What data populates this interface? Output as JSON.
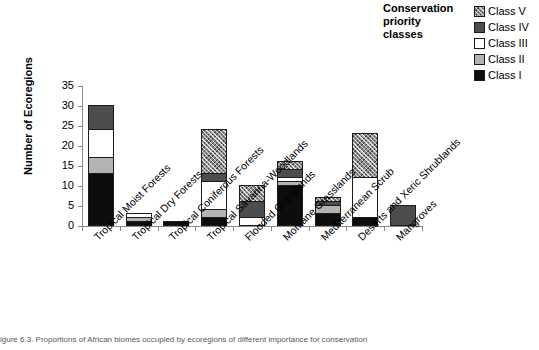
{
  "legend": {
    "title": "Conservation priority classes",
    "title_lines": [
      "Conservation",
      "priority",
      "classes"
    ],
    "items": [
      {
        "label": "Class V",
        "swatch": "hatched-gray",
        "color": "#8f8f8f"
      },
      {
        "label": "Class IV",
        "swatch": "dark-gray",
        "color": "#4d4d4d"
      },
      {
        "label": "Class III",
        "swatch": "white",
        "color": "#ffffff"
      },
      {
        "label": "Class II",
        "swatch": "light-gray",
        "color": "#b3b3b3"
      },
      {
        "label": "Class I",
        "swatch": "black",
        "color": "#0d0d0d"
      }
    ]
  },
  "axes": {
    "y_title": "Number of Ecoregions",
    "y_ticks": [
      "0",
      "5",
      "10",
      "15",
      "20",
      "25",
      "30",
      "35"
    ]
  },
  "caption": "igure 6.3. Proportions of African biomes occupied by ecoregions of different importance for conservation",
  "chart_data": {
    "type": "bar",
    "stacked": true,
    "title": "",
    "xlabel": "",
    "ylabel": "Number of Ecoregions",
    "ylim": [
      0,
      35
    ],
    "ytick_step": 5,
    "grid": false,
    "legend_position": "top-right",
    "legend_title": "Conservation priority classes",
    "categories": [
      "Tropical Moist Forests",
      "Tropical Dry Forests",
      "Tropical Coniferous Forests",
      "Tropical Savanna-Woodlands",
      "Flooded Grasslands",
      "Montane Grasslands",
      "Mediterranean Scrub",
      "Deserts and Xeric Shrublands",
      "Mangroves"
    ],
    "series": [
      {
        "name": "Class I",
        "color": "#0d0d0d",
        "values": [
          13,
          1,
          1,
          2,
          0,
          10,
          3,
          2,
          0
        ]
      },
      {
        "name": "Class II",
        "color": "#b3b3b3",
        "values": [
          4,
          1,
          0,
          2,
          0,
          1,
          2,
          0,
          0
        ]
      },
      {
        "name": "Class III",
        "color": "#ffffff",
        "values": [
          7,
          1,
          0,
          7,
          2,
          1,
          0,
          10,
          0
        ]
      },
      {
        "name": "Class IV",
        "color": "#4d4d4d",
        "values": [
          6,
          0,
          0,
          2,
          4,
          2,
          1,
          0,
          5
        ]
      },
      {
        "name": "Class V",
        "color": "#8f8f8f",
        "values": [
          0,
          0,
          0,
          11,
          4,
          2,
          1,
          11,
          0
        ]
      }
    ],
    "totals": [
      30,
      3,
      1,
      24,
      10,
      16,
      7,
      23,
      5
    ]
  }
}
